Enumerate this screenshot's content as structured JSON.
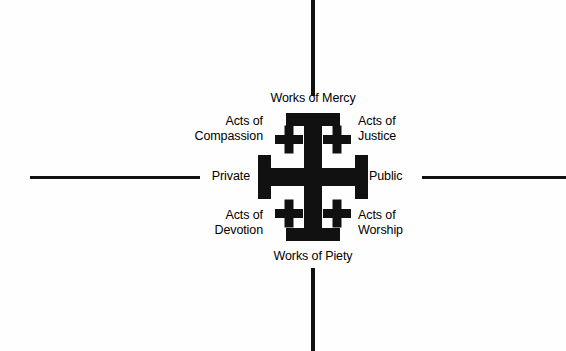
{
  "diagram": {
    "background_color": "#fefefe",
    "ink_color": "#111111",
    "axes": {
      "vertical_top": {
        "name": "axis-line-top"
      },
      "vertical_bottom": {
        "name": "axis-line-bottom"
      },
      "horizontal_left": {
        "name": "axis-line-left"
      },
      "horizontal_right": {
        "name": "axis-line-right"
      }
    },
    "labels": {
      "top": "Works of Mercy",
      "bottom": "Works of Piety",
      "left": "Private",
      "right": "Public",
      "quadrant_top_left": "Acts of\nCompassion",
      "quadrant_top_right": "Acts of\nJustice",
      "quadrant_bottom_left": "Acts of\nDevotion",
      "quadrant_bottom_right": "Acts of\nWorship"
    },
    "cross": {
      "name": "jerusalem-cross",
      "fill": "#111111",
      "small_cross_count": 4
    }
  }
}
